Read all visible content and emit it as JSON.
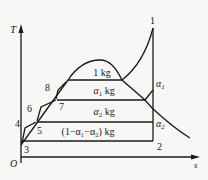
{
  "diagram": {
    "type": "T-s diagram, regenerative cycle with two feedwater heaters",
    "axes": {
      "y_label": "T",
      "x_label": "s",
      "origin_label": "O"
    },
    "points": {
      "p1": "1",
      "p2": "2",
      "p3": "3",
      "p4": "4",
      "p5": "5",
      "p6": "6",
      "p7": "7",
      "p8": "8",
      "a1": "α",
      "a1_sub": "1",
      "a2": "α",
      "a2_sub": "2"
    },
    "regions": {
      "r1": "1 kg",
      "r2_a": "α",
      "r2_sub": "1",
      "r2_b": " kg",
      "r3_a": "α",
      "r3_sub": "2",
      "r3_b": " kg",
      "r4": "(1−α₁−α₂) kg"
    }
  }
}
